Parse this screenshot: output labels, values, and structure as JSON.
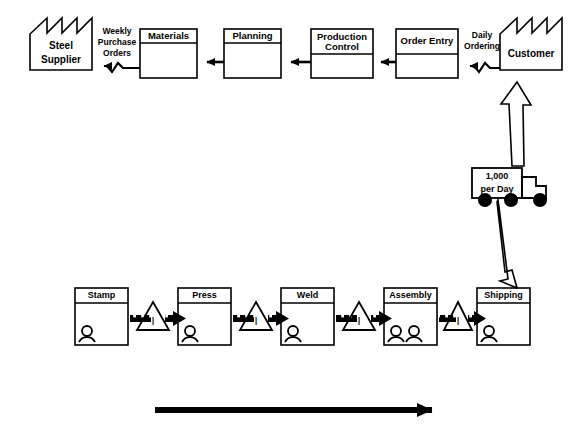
{
  "diagram": {
    "type": "value-stream-map",
    "colors": {
      "line": "#000000",
      "fill": "#ffffff",
      "background": "#ffffff"
    }
  },
  "external_entities": [
    {
      "id": "steel-supplier",
      "label_line1": "Steel",
      "label_line2": "Supplier",
      "shape": "factory",
      "x": 30,
      "y": 18,
      "w": 62,
      "h": 52
    },
    {
      "id": "customer",
      "label_line1": "Customer",
      "label_line2": "",
      "shape": "factory",
      "x": 500,
      "y": 18,
      "w": 62,
      "h": 52
    }
  ],
  "information_boxes": [
    {
      "id": "materials",
      "label": "Materials",
      "x": 140,
      "y": 29,
      "w": 57,
      "h": 49
    },
    {
      "id": "planning",
      "label": "Planning",
      "x": 224,
      "y": 29,
      "w": 57,
      "h": 49
    },
    {
      "id": "production-control",
      "label_line1": "Production",
      "label_line2": "Control",
      "label": "Production Control",
      "x": 311,
      "y": 29,
      "w": 62,
      "h": 49
    },
    {
      "id": "order-entry",
      "label": "Order Entry",
      "x": 396,
      "y": 29,
      "w": 62,
      "h": 49
    }
  ],
  "information_flows": [
    {
      "id": "weekly-purchase-orders",
      "label_line1": "Weekly",
      "label_line2": "Purchase",
      "label_line3": "Orders",
      "label": "Weekly Purchase Orders",
      "from": "materials",
      "to": "steel-supplier",
      "style": "electronic-zigzag"
    },
    {
      "id": "daily-ordering",
      "label_line1": "Daily",
      "label_line2": "Ordering",
      "label": "Daily Ordering",
      "from": "customer",
      "to": "order-entry",
      "style": "electronic-zigzag"
    }
  ],
  "shipment": {
    "id": "truck-shipment",
    "label_line1": "1,000",
    "label_line2": "per Day",
    "label": "1,000 per Day",
    "icon": "truck-icon",
    "x": 472,
    "y": 168,
    "w": 50,
    "h": 30
  },
  "process_steps": [
    {
      "id": "stamp",
      "label": "Stamp",
      "operators": 1,
      "x": 75,
      "y": 288,
      "w": 53,
      "h": 57
    },
    {
      "id": "press",
      "label": "Press",
      "operators": 1,
      "x": 178,
      "y": 288,
      "w": 53,
      "h": 57
    },
    {
      "id": "weld",
      "label": "Weld",
      "operators": 1,
      "x": 281,
      "y": 288,
      "w": 53,
      "h": 57
    },
    {
      "id": "assembly",
      "label": "Assembly",
      "operators": 2,
      "x": 384,
      "y": 288,
      "w": 53,
      "h": 57
    },
    {
      "id": "shipping",
      "label": "Shipping",
      "operators": 1,
      "x": 477,
      "y": 288,
      "w": 53,
      "h": 57
    }
  ],
  "inventory_markers": [
    {
      "id": "inventory-1",
      "label": "I",
      "between": "stamp-press",
      "x": 153,
      "y": 317
    },
    {
      "id": "inventory-2",
      "label": "I",
      "between": "press-weld",
      "x": 256,
      "y": 317
    },
    {
      "id": "inventory-3",
      "label": "I",
      "between": "weld-assembly",
      "x": 359,
      "y": 317
    },
    {
      "id": "inventory-4",
      "label": "I",
      "between": "assembly-shipping",
      "x": 458,
      "y": 317
    }
  ],
  "material_flows": [
    {
      "id": "push-stamp-press",
      "style": "push-arrow"
    },
    {
      "id": "push-press-weld",
      "style": "push-arrow"
    },
    {
      "id": "push-weld-assembly",
      "style": "push-arrow"
    },
    {
      "id": "push-assembly-shipping",
      "style": "push-arrow"
    },
    {
      "id": "ship-shipping-truck",
      "style": "hollow-arrow"
    },
    {
      "id": "ship-truck-customer",
      "style": "hollow-arrow"
    }
  ],
  "timeline_arrow": {
    "id": "timeline-arrow",
    "direction": "right",
    "x1": 155,
    "x2": 443,
    "y": 410
  }
}
